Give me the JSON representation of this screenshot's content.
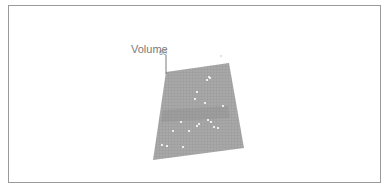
{
  "chart_data": {
    "type": "scatter3d",
    "title": "",
    "axes": {
      "z": {
        "label": "Volume",
        "visible_ticks": [
          "60"
        ]
      },
      "x": {
        "label": ""
      },
      "y": {
        "label": ""
      }
    },
    "surface": {
      "type": "regression-plane",
      "color": "#9a9a9a",
      "corners_px": [
        [
          166,
          72
        ],
        [
          229,
          63
        ],
        [
          244,
          148
        ],
        [
          153,
          160
        ]
      ]
    },
    "points_px": [
      [
        209,
        77
      ],
      [
        207,
        80
      ],
      [
        210,
        78
      ],
      [
        197,
        92
      ],
      [
        195,
        99
      ],
      [
        205,
        103
      ],
      [
        181,
        122
      ],
      [
        199,
        124
      ],
      [
        208,
        120
      ],
      [
        197,
        126
      ],
      [
        211,
        122
      ],
      [
        214,
        127
      ],
      [
        173,
        131
      ],
      [
        189,
        131
      ],
      [
        162,
        145
      ],
      [
        167,
        146
      ],
      [
        183,
        147
      ],
      [
        223,
        106
      ],
      [
        218,
        128
      ]
    ],
    "point_color": "#ffffff",
    "grid": true,
    "legend": null
  },
  "labels": {
    "z_axis_title": "Volume",
    "z_tick_top": "60"
  },
  "colors": {
    "frame_border": "#9a9a9a",
    "surface": "#9a9a9a",
    "surface_band": "#8a8a8a",
    "axis": "#7a7a7a",
    "text": "#7a7a7a"
  }
}
